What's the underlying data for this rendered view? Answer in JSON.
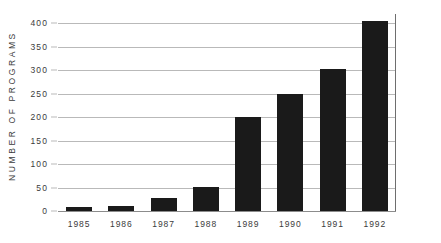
{
  "chart_data": {
    "type": "bar",
    "title": "",
    "subtitle": "",
    "xlabel": "",
    "ylabel": "NUMBER OF PROGRAMS",
    "categories": [
      "1985",
      "1986",
      "1987",
      "1988",
      "1989",
      "1990",
      "1991",
      "1992"
    ],
    "values": [
      8,
      11,
      28,
      52,
      200,
      250,
      302,
      405
    ],
    "series": [
      {
        "name": "Number of programs",
        "values": [
          8,
          11,
          28,
          52,
          200,
          250,
          302,
          405
        ]
      }
    ],
    "ylim": [
      0,
      420
    ],
    "ytick_values": [
      0,
      50,
      100,
      150,
      200,
      250,
      300,
      350,
      400
    ],
    "ytick_labels": [
      "0",
      "50",
      "100",
      "150",
      "200",
      "250",
      "300",
      "350",
      "400"
    ],
    "grid": true,
    "grid_axis": "y",
    "legend": false,
    "legend_position": "none",
    "bar_color": "#1a1a1a",
    "grid_color": "#b9b9b9",
    "axis_color": "#8c8c8c",
    "background_color": "#ffffff",
    "text_color": "#3b3b3b",
    "annotations": []
  }
}
